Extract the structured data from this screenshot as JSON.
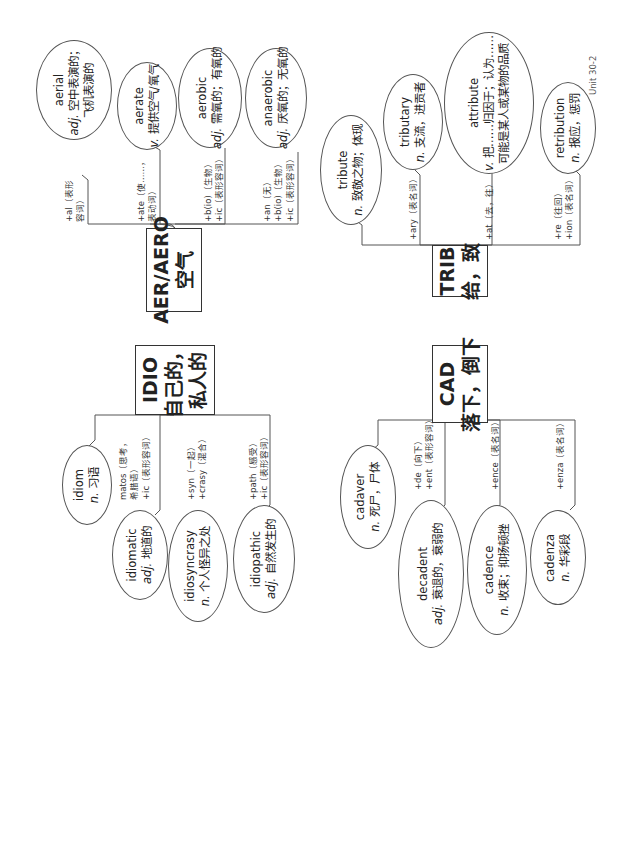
{
  "page": {
    "unit_label": "Unit 30-2"
  },
  "groups": {
    "aer": {
      "root": {
        "title": "AER/AERO",
        "meaning": "空气"
      },
      "words": [
        {
          "word": "aerial",
          "pos": "adj.",
          "def": "空中表演的；",
          "def2": "飞机表演的",
          "affix1": "+al（表形",
          "affix2": "容词）",
          "affix3": ""
        },
        {
          "word": "aerate",
          "pos": "v.",
          "def": "提供空气/氧气",
          "def2": "",
          "affix1": "+ate（使……，",
          "affix2": "表动词）",
          "affix3": ""
        },
        {
          "word": "aerobic",
          "pos": "adj.",
          "def": "需氧的；有氧的",
          "def2": "",
          "affix1": "+b(io)（生物）",
          "affix2": "+ic（表形容词）",
          "affix3": ""
        },
        {
          "word": "anaerobic",
          "pos": "adj.",
          "def": "厌氧的；无氧的",
          "def2": "",
          "affix1": "+an（无）",
          "affix2": "+b(io)（生物）",
          "affix3": "+ic（表形容词）"
        }
      ]
    },
    "trib": {
      "root": {
        "title": "TRIB",
        "meaning": "给，致"
      },
      "words": [
        {
          "word": "tribute",
          "pos": "n.",
          "def": "致敬之物；体现",
          "def2": "",
          "affix1": "",
          "affix2": "",
          "affix3": ""
        },
        {
          "word": "tributary",
          "pos": "n.",
          "def": "支流，进贡者",
          "def2": "",
          "affix1": "+ary（表名词）",
          "affix2": "",
          "affix3": ""
        },
        {
          "word": "attribute",
          "pos": "v.",
          "def": "把……归因于；认为……",
          "def2": "可能是某人或某物的品质",
          "affix1": "+at（去，往）",
          "affix2": "",
          "affix3": ""
        },
        {
          "word": "retribution",
          "pos": "n.",
          "def": "报应，惩罚",
          "def2": "",
          "affix1": "+re（往回）",
          "affix2": "+ion（表名词）",
          "affix3": ""
        }
      ]
    },
    "idio": {
      "root": {
        "title": "IDIO",
        "meaning": "自己的，",
        "meaning2": "私人的"
      },
      "words": [
        {
          "word": "idiom",
          "pos": "n.",
          "def": "习语",
          "affix1": "",
          "affix2": "",
          "affix3": ""
        },
        {
          "word": "idiomatic",
          "pos": "adj.",
          "def": "地道的",
          "affix1": "matos（思考，",
          "affix2": "希腊语）",
          "affix3": "+ic（表形容词）"
        },
        {
          "word": "idiosyncrasy",
          "pos": "n.",
          "def": "个人怪异之处",
          "affix1": "+syn（一起）",
          "affix2": "+crasy（混合）",
          "affix3": ""
        },
        {
          "word": "idiopathic",
          "pos": "adj.",
          "def": "自然发生的",
          "affix1": "+path（感受）",
          "affix2": "+ic（表形容词）",
          "affix3": ""
        }
      ]
    },
    "cad": {
      "root": {
        "title": "CAD",
        "meaning": "落下，倒下"
      },
      "words": [
        {
          "word": "cadaver",
          "pos": "n.",
          "def": "死尸，尸体",
          "affix1": "",
          "affix2": "",
          "affix3": ""
        },
        {
          "word": "decadent",
          "pos": "adj.",
          "def": "衰退的，衰弱的",
          "affix1": "+de（向下）",
          "affix2": "+ent（表形容词）",
          "affix3": ""
        },
        {
          "word": "cadence",
          "pos": "n.",
          "def": "收束；抑扬顿挫",
          "affix1": "+ence（表名词）",
          "affix2": "",
          "affix3": ""
        },
        {
          "word": "cadenza",
          "pos": "n.",
          "def": "华彩段",
          "affix1": "+enza（表名词）",
          "affix2": "",
          "affix3": ""
        }
      ]
    }
  }
}
